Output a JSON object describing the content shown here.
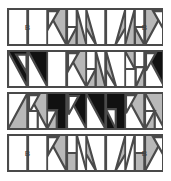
{
  "figure": {
    "name": "quilt-block-strip-diagram",
    "rows_count": 4,
    "units_per_row": 8,
    "colors": {
      "white": "#ffffff",
      "gray": "#b8b8b8",
      "black": "#111111",
      "line": "#4a4a4a",
      "label_text": "#3d3d3d"
    },
    "labels": {
      "b": "B"
    }
  },
  "rows": [
    {
      "name": "row-1",
      "units": [
        {
          "name": "plain-white-b-left",
          "type": "plain",
          "fill": "white",
          "label": "B",
          "span": 2
        },
        {
          "name": "half-square-gray-top-left",
          "type": "hst",
          "orient": "tl",
          "fill": "gray"
        },
        {
          "name": "quarter-gray-white-notch",
          "type": "notch",
          "orient": "tl",
          "fill": "gray"
        },
        {
          "name": "hst-gray-bottom-right-down",
          "type": "hst",
          "orient": "br",
          "fill": "gray"
        },
        {
          "name": "hst-gray-bottom-left-up",
          "type": "hst",
          "orient": "bl",
          "fill": "gray"
        },
        {
          "name": "quarter-gray-white-notch-mirror",
          "type": "notch",
          "orient": "tr",
          "fill": "gray"
        },
        {
          "name": "half-square-gray-top-right",
          "type": "hst",
          "orient": "tr",
          "fill": "gray"
        },
        {
          "name": "plain-white-b-right",
          "type": "plain",
          "fill": "white",
          "label": "B",
          "span": 2
        }
      ]
    },
    {
      "name": "row-2",
      "units": [
        {
          "name": "hst-black-top-right",
          "type": "hst",
          "orient": "tr",
          "fill": "black"
        },
        {
          "name": "notch-black-white",
          "type": "notch",
          "orient": "tl",
          "fill": "black"
        },
        {
          "name": "plain-white",
          "type": "plain",
          "fill": "white"
        },
        {
          "name": "hst-gray-top-left",
          "type": "hst",
          "orient": "tl",
          "fill": "gray"
        },
        {
          "name": "notch-gray-white",
          "type": "notch",
          "orient": "tl",
          "fill": "gray"
        },
        {
          "name": "hst-gray-bottom-right",
          "type": "hst",
          "orient": "br",
          "fill": "gray"
        },
        {
          "name": "hst-gray-bottom-left",
          "type": "hst",
          "orient": "bl",
          "fill": "gray"
        },
        {
          "name": "notch-gray-white-mirror",
          "type": "notch",
          "orient": "tr",
          "fill": "gray"
        },
        {
          "name": "notch-black-white-right",
          "type": "notch",
          "orient": "tr",
          "fill": "black"
        },
        {
          "name": "hst-black-top-left",
          "type": "hst",
          "orient": "tl",
          "fill": "black"
        }
      ]
    },
    {
      "name": "row-3",
      "units": [
        {
          "name": "hst-gray-top-right-pale",
          "type": "hst",
          "orient": "tr",
          "fill": "gray"
        },
        {
          "name": "notch-gray-white-left",
          "type": "notch",
          "orient": "tl",
          "fill": "gray"
        },
        {
          "name": "hst-black-top-right-mid",
          "type": "hst",
          "orient": "tr",
          "fill": "black"
        },
        {
          "name": "notch-black-white-mid",
          "type": "notch",
          "orient": "tl",
          "fill": "black"
        },
        {
          "name": "hst-black-top-left-mid",
          "type": "hst",
          "orient": "tl",
          "fill": "black"
        },
        {
          "name": "notch-black-white-mid-right",
          "type": "notch",
          "orient": "tr",
          "fill": "black"
        },
        {
          "name": "hst-gray-top-left-right",
          "type": "hst",
          "orient": "tl",
          "fill": "gray"
        },
        {
          "name": "notch-gray-white-right",
          "type": "notch",
          "orient": "tr",
          "fill": "gray"
        }
      ]
    },
    {
      "name": "row-4",
      "units": [
        {
          "name": "plain-white-b-left",
          "type": "plain",
          "fill": "white",
          "label": "B",
          "span": 2
        },
        {
          "name": "hst-gray-top-left",
          "type": "hst",
          "orient": "tl",
          "fill": "gray"
        },
        {
          "name": "notch-gray-white",
          "type": "notch",
          "orient": "tl",
          "fill": "gray"
        },
        {
          "name": "hst-gray-bottom-right",
          "type": "hst",
          "orient": "br",
          "fill": "gray"
        },
        {
          "name": "hst-gray-bottom-left",
          "type": "hst",
          "orient": "bl",
          "fill": "gray"
        },
        {
          "name": "notch-gray-white-mirror",
          "type": "notch",
          "orient": "tr",
          "fill": "gray"
        },
        {
          "name": "hst-gray-top-right",
          "type": "hst",
          "orient": "tr",
          "fill": "gray"
        },
        {
          "name": "plain-white-b-right",
          "type": "plain",
          "fill": "white",
          "label": "B",
          "span": 2
        }
      ]
    }
  ],
  "layout": {
    "row_tops": [
      8,
      50,
      92,
      134
    ],
    "row_height": 38,
    "row_left": 7,
    "row_width": 156
  }
}
